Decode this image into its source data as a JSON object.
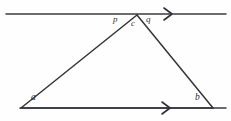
{
  "figure": {
    "type": "geometry-diagram",
    "background_color": "#fefefe",
    "stroke_color": "#34343c"
  },
  "labels": {
    "vertex_a": "a",
    "vertex_b": "b",
    "vertex_c": "c",
    "angle_p": "p",
    "angle_q": "q"
  },
  "geometry": {
    "top_parallel_line": {
      "name": "top-parallel-line",
      "x1": 6,
      "y1": 14,
      "x2": 226,
      "y2": 14,
      "arrow_marker_x": 168
    },
    "bottom_parallel_line": {
      "name": "bottom-parallel-line",
      "x1": 20,
      "y1": 108,
      "x2": 226,
      "y2": 108,
      "arrow_marker_x": 166
    },
    "triangle": {
      "vertex_a": {
        "x": 21,
        "y": 108
      },
      "vertex_b": {
        "x": 213,
        "y": 108
      },
      "vertex_c": {
        "x": 137,
        "y": 15
      }
    }
  },
  "label_positions": {
    "a": {
      "x": 31,
      "y": 95
    },
    "b": {
      "x": 195,
      "y": 95
    },
    "c": {
      "x": 131,
      "y": 19
    },
    "p": {
      "x": 113,
      "y": 16
    },
    "q": {
      "x": 145,
      "y": 16
    }
  }
}
